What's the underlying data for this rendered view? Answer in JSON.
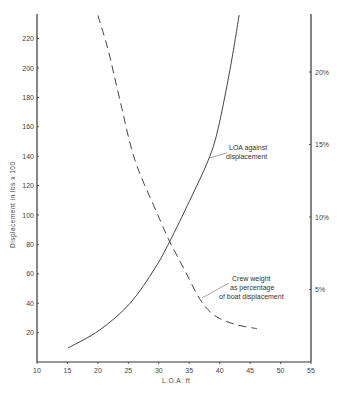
{
  "chart_data": {
    "type": "line",
    "title": "",
    "xlabel": "L.O.A. ft",
    "ylabel": "Displacement in lbs x 100",
    "y2label": "",
    "xlim": [
      10,
      55
    ],
    "ylim": [
      0,
      240
    ],
    "y2lim": [
      0,
      24.8
    ],
    "x_ticks": [
      10,
      15,
      20,
      25,
      30,
      35,
      40,
      45,
      50,
      55
    ],
    "y_ticks": [
      20,
      40,
      60,
      80,
      100,
      120,
      140,
      160,
      180,
      200,
      220
    ],
    "y2_ticks": [
      "5%",
      "10%",
      "15%",
      "20%"
    ],
    "y2_tick_values": [
      5,
      10,
      15,
      20
    ],
    "grid": false,
    "legend": "none (inline annotations)",
    "series": [
      {
        "name": "LOA against displacement",
        "axis": "left",
        "style": "solid",
        "x": [
          15.1,
          20.3,
          25.3,
          29.4,
          31.8,
          35.1,
          38.1,
          39.7,
          41.7,
          43.2
        ],
        "y": [
          9.5,
          21.8,
          40,
          64,
          82,
          110,
          137,
          158,
          199,
          236
        ]
      },
      {
        "name": "Crew weight as percentage of boat displacement",
        "axis": "right",
        "style": "dashed",
        "x": [
          20.0,
          21.7,
          23.6,
          26.1,
          29.9,
          31.8,
          34.3,
          36.8,
          39.2,
          42.5,
          46.1
        ],
        "y": [
          23.9,
          21.5,
          18.1,
          13.9,
          10.1,
          8.3,
          6.3,
          4.3,
          3.2,
          2.6,
          2.3
        ]
      }
    ],
    "annotations": [
      {
        "lines": [
          "LOA against",
          "displacement"
        ]
      },
      {
        "lines": [
          "Crew weight",
          "as percentage",
          "of boat displacement"
        ]
      }
    ]
  },
  "labels": {
    "xlabel": "L.O.A. ft",
    "ylabel": "Displacement in lbs x 100",
    "ann1_l1": "LOA against",
    "ann1_l2": "displacement",
    "ann2_l1": "Crew weight",
    "ann2_l2": "as percentage",
    "ann2_l3": "of boat displacement"
  },
  "colors": {
    "axis": "#333333",
    "curve": "#444444",
    "text": "#444444",
    "background": "#ffffff"
  }
}
